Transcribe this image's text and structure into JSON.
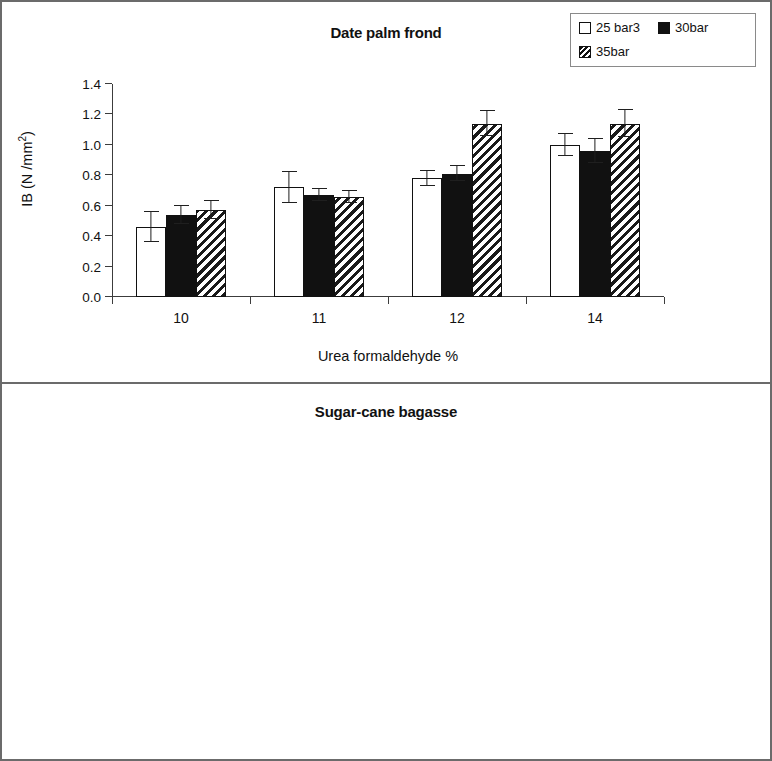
{
  "figure": {
    "border_color": "#6b6b6b",
    "background": "#ffffff"
  },
  "legend": {
    "items": [
      {
        "label": "25 bar3",
        "swatch": "white-square-icon",
        "color": "#ffffff"
      },
      {
        "label": "30bar",
        "swatch": "black-square-icon",
        "color": "#111111"
      },
      {
        "label": "35bar",
        "swatch": "hatched-square-icon",
        "color": "#1a1a1a"
      }
    ]
  },
  "panels": [
    {
      "id": "top",
      "title": "Date palm frond"
    },
    {
      "id": "bottom",
      "title": "Sugar-cane bagasse"
    }
  ],
  "axis": {
    "y_title_main": "IB  (N /mm",
    "y_title_sup": "2",
    "y_title_close": ")",
    "y_ticks": [
      "1.4",
      "1.2",
      "1.0",
      "0.8",
      "0.6",
      "0.4",
      "0.2",
      "0.0"
    ],
    "x_ticks": [
      "10",
      "11",
      "12",
      "14"
    ],
    "x_title": "Urea formaldehyde %"
  },
  "chart_data": [
    {
      "type": "bar",
      "title": "Date palm frond",
      "xlabel": "Urea formaldehyde %",
      "ylabel": "IB (N /mm2)",
      "ylim": [
        0.0,
        1.4
      ],
      "ytick_step": 0.2,
      "grid": false,
      "legend_position": "top-right",
      "categories": [
        "10",
        "11",
        "12",
        "14"
      ],
      "series": [
        {
          "name": "25 bar3",
          "values": [
            0.46,
            0.72,
            0.78,
            1.0
          ],
          "errors": [
            0.1,
            0.1,
            0.05,
            0.07
          ]
        },
        {
          "name": "30bar",
          "values": [
            0.54,
            0.67,
            0.81,
            0.96
          ],
          "errors": [
            0.06,
            0.04,
            0.05,
            0.08
          ]
        },
        {
          "name": "35bar",
          "values": [
            0.57,
            0.66,
            1.14,
            1.14
          ],
          "errors": [
            0.06,
            0.04,
            0.08,
            0.09
          ]
        }
      ]
    },
    {
      "type": "bar",
      "title": "Sugar-cane bagasse",
      "xlabel": "Urea formaldehyde %",
      "ylabel": "IB (N /mm2)",
      "ylim": [
        0.0,
        1.4
      ],
      "ytick_step": 0.2,
      "grid": false,
      "legend_position": "none",
      "categories": [
        "10",
        "11",
        "12",
        "14"
      ],
      "series": [
        {
          "name": "25 bar3",
          "values": [
            0.66,
            0.71,
            0.82,
            1.04
          ],
          "errors": [
            0.07,
            0.07,
            0.07,
            0.06
          ]
        },
        {
          "name": "30bar",
          "values": [
            0.58,
            0.65,
            0.87,
            1.1
          ],
          "errors": [
            0.05,
            0.04,
            0.06,
            0.07
          ]
        },
        {
          "name": "35bar",
          "values": [
            0.58,
            0.68,
            0.86,
            1.18
          ],
          "errors": [
            0.05,
            0.05,
            0.07,
            0.08
          ]
        }
      ]
    }
  ]
}
